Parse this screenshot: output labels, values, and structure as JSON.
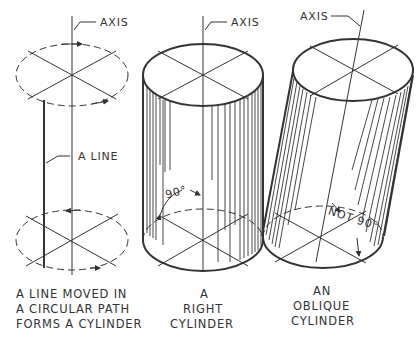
{
  "figure": {
    "panels": [
      {
        "id": "generation",
        "axis_label": "AXIS",
        "line_label": "A LINE",
        "caption": [
          "A LINE MOVED IN",
          "A CIRCULAR PATH",
          "FORMS A CYLINDER"
        ]
      },
      {
        "id": "right",
        "axis_label": "AXIS",
        "angle_label": "90°",
        "caption": [
          "A",
          "RIGHT",
          "CYLINDER"
        ]
      },
      {
        "id": "oblique",
        "axis_label": "AXIS",
        "angle_label": "NOT 90°",
        "caption": [
          "AN",
          "OBLIQUE",
          "CYLINDER"
        ]
      }
    ],
    "colors": {
      "ink": "#222222",
      "background": "#ffffff"
    }
  }
}
